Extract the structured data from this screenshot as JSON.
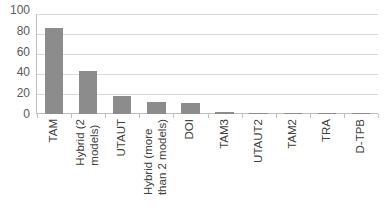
{
  "chart_data": {
    "type": "bar",
    "title": "",
    "subtitle": "",
    "xlabel": "",
    "ylabel": "",
    "ylim": [
      0,
      100
    ],
    "yticks": [
      0,
      20,
      40,
      60,
      80,
      100
    ],
    "grid": true,
    "legend": false,
    "legend_position": "none",
    "orientation": "vertical",
    "bar_color": "#8c8c8c",
    "gridline_color": "#d9d9d9",
    "axis_color": "#bfbfbf",
    "tick_label_color": "#595959",
    "category_label_color": "#404040",
    "category_label_rotation": -90,
    "categories": [
      "TAM",
      "Hybrid (2\nmodels)",
      "UTAUT",
      "Hybrid (more\nthan 2 models)",
      "DOI",
      "TAM3",
      "UTAUT2",
      "TAM2",
      "TRA",
      "D-TPB"
    ],
    "values": [
      86,
      43,
      18,
      12,
      11,
      2,
      1,
      1,
      0.5,
      0.5
    ],
    "series": [
      {
        "name": "Count",
        "values": [
          86,
          43,
          18,
          12,
          11,
          2,
          1,
          1,
          0.5,
          0.5
        ]
      }
    ]
  }
}
